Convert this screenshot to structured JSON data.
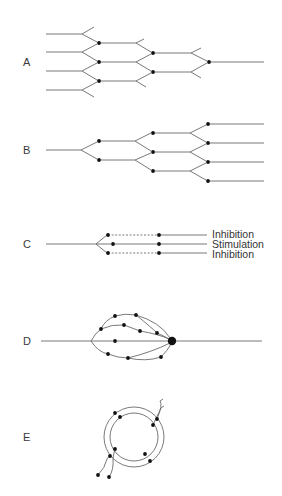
{
  "figure": {
    "panels": [
      {
        "id": "A",
        "label": "A",
        "label_pos": [
          23,
          66
        ],
        "description": "Convergence: four inputs merging to a single output"
      },
      {
        "id": "B",
        "label": "B",
        "label_pos": [
          23,
          154
        ],
        "description": "Divergence: single input fanning out to four outputs"
      },
      {
        "id": "C",
        "label": "C",
        "label_pos": [
          23,
          248
        ],
        "description": "Lateral inhibition: one input to three outputs"
      },
      {
        "id": "D",
        "label": "D",
        "label_pos": [
          23,
          345
        ],
        "description": "Multiple parallel pathways converging on one neuron"
      },
      {
        "id": "E",
        "label": "E",
        "label_pos": [
          23,
          441
        ],
        "description": "Reverberating (recurrent) circuit"
      }
    ],
    "panel_c_labels": [
      {
        "text": "Inhibition",
        "x": 212,
        "y": 238
      },
      {
        "text": "Stimulation",
        "x": 212,
        "y": 248
      },
      {
        "text": "Inhibition",
        "x": 212,
        "y": 258
      }
    ],
    "colors": {
      "line": "#6a6a6a",
      "node": "#111111",
      "text": "#333333"
    }
  },
  "geometry": {
    "A": {
      "lines": [
        [
          [
            46,
            34
          ],
          [
            82,
            34
          ]
        ],
        [
          [
            82,
            34
          ],
          [
            94,
            27
          ]
        ],
        [
          [
            82,
            34
          ],
          [
            97,
            42
          ]
        ],
        [
          [
            46,
            52
          ],
          [
            82,
            52
          ]
        ],
        [
          [
            82,
            52
          ],
          [
            97,
            44
          ]
        ],
        [
          [
            82,
            52
          ],
          [
            97,
            61
          ]
        ],
        [
          [
            46,
            71
          ],
          [
            82,
            71
          ]
        ],
        [
          [
            82,
            71
          ],
          [
            97,
            63
          ]
        ],
        [
          [
            82,
            71
          ],
          [
            97,
            80
          ]
        ],
        [
          [
            46,
            90
          ],
          [
            82,
            90
          ]
        ],
        [
          [
            82,
            90
          ],
          [
            97,
            82
          ]
        ],
        [
          [
            82,
            90
          ],
          [
            94,
            97
          ]
        ],
        [
          [
            99,
            43
          ],
          [
            136,
            43
          ]
        ],
        [
          [
            136,
            43
          ],
          [
            144,
            39
          ]
        ],
        [
          [
            136,
            43
          ],
          [
            151,
            52
          ]
        ],
        [
          [
            99,
            62
          ],
          [
            136,
            62
          ]
        ],
        [
          [
            136,
            62
          ],
          [
            151,
            54
          ]
        ],
        [
          [
            136,
            62
          ],
          [
            151,
            71
          ]
        ],
        [
          [
            99,
            81
          ],
          [
            136,
            81
          ]
        ],
        [
          [
            136,
            81
          ],
          [
            151,
            73
          ]
        ],
        [
          [
            136,
            81
          ],
          [
            146,
            87
          ]
        ],
        [
          [
            153,
            53
          ],
          [
            191,
            53
          ]
        ],
        [
          [
            191,
            53
          ],
          [
            201,
            48
          ]
        ],
        [
          [
            191,
            53
          ],
          [
            207,
            61
          ]
        ],
        [
          [
            153,
            72
          ],
          [
            191,
            72
          ]
        ],
        [
          [
            191,
            72
          ],
          [
            207,
            63
          ]
        ],
        [
          [
            191,
            72
          ],
          [
            201,
            78
          ]
        ],
        [
          [
            209,
            62
          ],
          [
            264,
            62
          ]
        ]
      ],
      "dots": [
        [
          99,
          43
        ],
        [
          99,
          62
        ],
        [
          99,
          81
        ],
        [
          153,
          53
        ],
        [
          153,
          72
        ],
        [
          209,
          62
        ]
      ],
      "dot_r": 1.9
    },
    "B": {
      "lines": [
        [
          [
            46,
            150
          ],
          [
            81,
            150
          ]
        ],
        [
          [
            81,
            150
          ],
          [
            97,
            142
          ]
        ],
        [
          [
            81,
            150
          ],
          [
            97,
            159
          ]
        ],
        [
          [
            99,
            141
          ],
          [
            135,
            141
          ]
        ],
        [
          [
            135,
            141
          ],
          [
            151,
            133
          ]
        ],
        [
          [
            135,
            141
          ],
          [
            151,
            151
          ]
        ],
        [
          [
            99,
            160
          ],
          [
            135,
            160
          ]
        ],
        [
          [
            135,
            160
          ],
          [
            151,
            153
          ]
        ],
        [
          [
            135,
            160
          ],
          [
            151,
            170
          ]
        ],
        [
          [
            153,
            133
          ],
          [
            190,
            133
          ]
        ],
        [
          [
            190,
            133
          ],
          [
            206,
            125
          ]
        ],
        [
          [
            190,
            133
          ],
          [
            206,
            142
          ]
        ],
        [
          [
            153,
            152
          ],
          [
            190,
            152
          ]
        ],
        [
          [
            190,
            152
          ],
          [
            206,
            144
          ]
        ],
        [
          [
            190,
            152
          ],
          [
            206,
            161
          ]
        ],
        [
          [
            153,
            171
          ],
          [
            190,
            171
          ]
        ],
        [
          [
            190,
            171
          ],
          [
            206,
            163
          ]
        ],
        [
          [
            190,
            171
          ],
          [
            206,
            180
          ]
        ],
        [
          [
            208,
            124
          ],
          [
            264,
            124
          ]
        ],
        [
          [
            208,
            143
          ],
          [
            264,
            143
          ]
        ],
        [
          [
            208,
            162
          ],
          [
            264,
            162
          ]
        ],
        [
          [
            208,
            181
          ],
          [
            264,
            181
          ]
        ]
      ],
      "dots": [
        [
          99,
          141
        ],
        [
          99,
          160
        ],
        [
          153,
          133
        ],
        [
          153,
          152
        ],
        [
          153,
          171
        ],
        [
          208,
          124
        ],
        [
          208,
          143
        ],
        [
          208,
          162
        ],
        [
          208,
          181
        ]
      ],
      "dot_r": 1.9
    },
    "C": {
      "lines": [
        [
          [
            46,
            244
          ],
          [
            96,
            244
          ]
        ],
        [
          [
            96,
            244
          ],
          [
            107,
            235
          ]
        ],
        [
          [
            96,
            244
          ],
          [
            111,
            244
          ]
        ],
        [
          [
            96,
            244
          ],
          [
            107,
            253
          ]
        ],
        [
          [
            113,
            244
          ],
          [
            159,
            244
          ]
        ],
        [
          [
            159,
            235
          ],
          [
            207,
            235
          ]
        ],
        [
          [
            159,
            244
          ],
          [
            207,
            244
          ]
        ],
        [
          [
            159,
            253
          ],
          [
            207,
            253
          ]
        ]
      ],
      "dashed": [
        [
          [
            108,
            235
          ],
          [
            157,
            235
          ]
        ],
        [
          [
            108,
            253
          ],
          [
            157,
            253
          ]
        ]
      ],
      "dots": [
        [
          108,
          235
        ],
        [
          113,
          244
        ],
        [
          108,
          253
        ],
        [
          159,
          235
        ],
        [
          159,
          244
        ],
        [
          159,
          253
        ]
      ],
      "dot_r": 1.9
    },
    "D": {
      "lines": [
        [
          [
            41,
            341
          ],
          [
            91,
            341
          ]
        ],
        [
          [
            172,
            341
          ],
          [
            262,
            341
          ]
        ],
        [
          [
            91,
            341
          ],
          [
            113,
            341
          ]
        ],
        [
          [
            115,
            341
          ],
          [
            170,
            341
          ]
        ]
      ],
      "curves": [
        "M91,341 Q96,332 101,329",
        "M101,329 Q105,320 115,316",
        "M115,316 Q125,313 136,315",
        "M136,315 Q160,322 170,338",
        "M101,329 Q112,324 124,325",
        "M124,325 Q132,328 140,331",
        "M140,331 Q158,334 169,339",
        "M136,315 Q152,328 157,333",
        "M157,333 Q164,336 169,339",
        "M91,341 Q98,352 108,354",
        "M108,354 Q118,358 128,358",
        "M128,358 Q152,352 170,343",
        "M128,358 Q146,362 161,357",
        "M161,357 Q168,350 171,344"
      ],
      "dots": [
        [
          115,
          316
        ],
        [
          136,
          315
        ],
        [
          101,
          329
        ],
        [
          124,
          325
        ],
        [
          140,
          331
        ],
        [
          157,
          333
        ],
        [
          115,
          341
        ],
        [
          108,
          354
        ],
        [
          128,
          358
        ],
        [
          161,
          357
        ]
      ],
      "dot_r": 1.9,
      "big_dot": [
        172,
        341
      ],
      "big_dot_r": 4.2
    },
    "E": {
      "circles": [
        {
          "cx": 134,
          "cy": 437,
          "r": 30
        },
        {
          "cx": 134,
          "cy": 437,
          "r": 24
        }
      ],
      "curves": [
        "M98,475 Q105,468 107,459",
        "M107,459 Q108,457 110,456",
        "M109,477 Q114,470 113,458",
        "M113,458 Q114,452 115,449",
        "M153,425 Q160,410 161,408",
        "M157,419 Q163,405 160,401",
        "M161,408 L164,406",
        "M160,401 L163,399"
      ],
      "dots": [
        [
          115,
          413
        ],
        [
          120,
          417
        ],
        [
          157,
          419
        ],
        [
          153,
          425
        ],
        [
          115,
          449
        ],
        [
          110,
          456
        ],
        [
          145,
          454
        ],
        [
          150,
          461
        ],
        [
          98,
          475
        ],
        [
          109,
          477
        ]
      ],
      "dot_r": 1.9
    }
  }
}
